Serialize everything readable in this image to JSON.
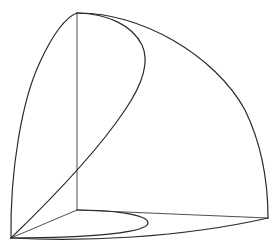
{
  "figure": {
    "type": "3d-solid-line-drawing",
    "background": "#ffffff",
    "stroke_color": "#2a2a2a",
    "points": {
      "apex": [
        77,
        13
      ],
      "origin_front_left": [
        11,
        238
      ],
      "back_corner": [
        77,
        210
      ],
      "right_corner": [
        268,
        218
      ],
      "inner_curve_extreme": [
        147,
        63
      ],
      "curve_cross_vertical": [
        77,
        170
      ],
      "ellipse_extreme": [
        148,
        223
      ]
    }
  }
}
